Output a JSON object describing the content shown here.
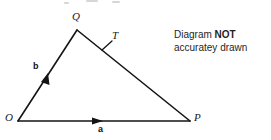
{
  "canvas": {
    "width": 271,
    "height": 140,
    "background": "#ffffff",
    "stroke_color": "#141414"
  },
  "figure": {
    "type": "vector-triangle-diagram",
    "vertices": [
      {
        "name": "O",
        "label": "O",
        "x": 18,
        "y": 121
      },
      {
        "name": "Q",
        "label": "Q",
        "x": 77,
        "y": 30
      },
      {
        "name": "P",
        "label": "P",
        "x": 190,
        "y": 121
      }
    ],
    "vertex_labels": [
      {
        "name": "O",
        "text": "O",
        "x": 5,
        "y": 114
      },
      {
        "name": "Q",
        "text": "Q",
        "x": 73,
        "y": 12
      },
      {
        "name": "P",
        "text": "P",
        "x": 194,
        "y": 114
      }
    ],
    "point_on_side": {
      "name": "T",
      "label": "T",
      "x": 108,
      "y": 47,
      "label_x": 112,
      "label_y": 31,
      "tick_mark": true
    },
    "vectors": [
      {
        "name": "a",
        "label": "a",
        "from": "O",
        "to": "P",
        "arrow_x": 100,
        "arrow_y": 121,
        "label_x": 98,
        "label_y": 126
      },
      {
        "name": "b",
        "label": "b",
        "from": "O",
        "to": "Q",
        "arrow_x": 47,
        "arrow_y": 76,
        "label_x": 33,
        "label_y": 63
      }
    ],
    "sides": [
      {
        "name": "side-OQ",
        "from": "O",
        "to": "Q"
      },
      {
        "name": "side-QP",
        "from": "Q",
        "to": "P"
      },
      {
        "name": "side-OP",
        "from": "O",
        "to": "P"
      }
    ]
  },
  "note": {
    "line1_prefix": "Diagram ",
    "line1_strong": "NOT",
    "line2": "accuratey drawn"
  }
}
